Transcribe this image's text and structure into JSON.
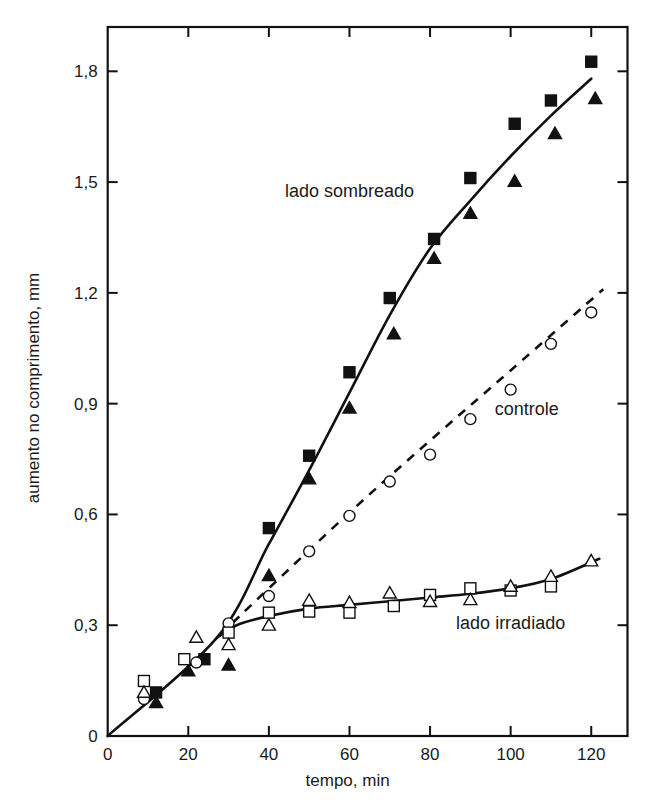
{
  "chart_data": {
    "type": "scatter",
    "title": "",
    "xlabel": "tempo, min",
    "ylabel": "aumento no comprimento, mm",
    "xlim": [
      0,
      129
    ],
    "ylim": [
      0,
      1.92
    ],
    "grid": false,
    "legend": "none (inline annotations)",
    "x_ticks": [
      0,
      20,
      40,
      60,
      80,
      100,
      120
    ],
    "x_tick_labels": [
      "0",
      "20",
      "40",
      "60",
      "80",
      "100",
      "120"
    ],
    "y_ticks": [
      0,
      0.3,
      0.6,
      0.9,
      1.2,
      1.5,
      1.8
    ],
    "y_tick_labels": [
      "0",
      "0,3",
      "0,6",
      "0,9",
      "1,2",
      "1,5",
      "1,8"
    ],
    "annotations": [
      {
        "text": "lado sombreado",
        "x": 60,
        "y": 1.46
      },
      {
        "text": "controle",
        "x": 104,
        "y": 0.87
      },
      {
        "text": "lado irradiado",
        "x": 100,
        "y": 0.29
      }
    ],
    "curves": [
      {
        "name": "lado sombreado",
        "style": "solid",
        "points": [
          [
            0,
            0
          ],
          [
            27,
            0.265
          ],
          [
            40,
            0.52
          ],
          [
            50,
            0.72
          ],
          [
            60,
            0.93
          ],
          [
            70,
            1.14
          ],
          [
            80,
            1.32
          ],
          [
            90,
            1.45
          ],
          [
            100,
            1.57
          ],
          [
            110,
            1.68
          ],
          [
            120,
            1.78
          ]
        ]
      },
      {
        "name": "controle",
        "style": "dashed",
        "points": [
          [
            28,
            0.275
          ],
          [
            40,
            0.4
          ],
          [
            60,
            0.605
          ],
          [
            80,
            0.8
          ],
          [
            100,
            0.99
          ],
          [
            123,
            1.21
          ]
        ]
      },
      {
        "name": "lado irradiado",
        "style": "solid",
        "points": [
          [
            27,
            0.265
          ],
          [
            32,
            0.3
          ],
          [
            40,
            0.325
          ],
          [
            50,
            0.345
          ],
          [
            60,
            0.355
          ],
          [
            70,
            0.365
          ],
          [
            80,
            0.375
          ],
          [
            90,
            0.385
          ],
          [
            100,
            0.4
          ],
          [
            110,
            0.425
          ],
          [
            122,
            0.48
          ]
        ]
      }
    ],
    "series": [
      {
        "name": "lado sombreado (quadrado cheio)",
        "marker": "filled-square",
        "points": [
          [
            12,
            0.118
          ],
          [
            24,
            0.208
          ],
          [
            40,
            0.563
          ],
          [
            50,
            0.759
          ],
          [
            60,
            0.985
          ],
          [
            70,
            1.186
          ],
          [
            81,
            1.346
          ],
          [
            90,
            1.511
          ],
          [
            101,
            1.658
          ],
          [
            110,
            1.721
          ],
          [
            120,
            1.826
          ]
        ]
      },
      {
        "name": "lado sombreado (triângulo cheio)",
        "marker": "filled-triangle",
        "points": [
          [
            12,
            0.09
          ],
          [
            20,
            0.176
          ],
          [
            30,
            0.192
          ],
          [
            40,
            0.434
          ],
          [
            50,
            0.696
          ],
          [
            60,
            0.888
          ],
          [
            71,
            1.089
          ],
          [
            81,
            1.293
          ],
          [
            90,
            1.415
          ],
          [
            101,
            1.502
          ],
          [
            111,
            1.631
          ],
          [
            121,
            1.726
          ]
        ]
      },
      {
        "name": "controle (círculo aberto)",
        "marker": "open-circle",
        "points": [
          [
            9,
            0.1
          ],
          [
            22,
            0.199
          ],
          [
            30,
            0.305
          ],
          [
            40,
            0.379
          ],
          [
            50,
            0.5
          ],
          [
            60,
            0.596
          ],
          [
            70,
            0.689
          ],
          [
            80,
            0.762
          ],
          [
            90,
            0.858
          ],
          [
            100,
            0.938
          ],
          [
            110,
            1.062
          ],
          [
            120,
            1.147
          ]
        ]
      },
      {
        "name": "lado irradiado (quadrado aberto)",
        "marker": "open-square",
        "points": [
          [
            9,
            0.149
          ],
          [
            19,
            0.208
          ],
          [
            30,
            0.28
          ],
          [
            40,
            0.334
          ],
          [
            50,
            0.337
          ],
          [
            60,
            0.334
          ],
          [
            71,
            0.352
          ],
          [
            80,
            0.382
          ],
          [
            90,
            0.4
          ],
          [
            100,
            0.394
          ],
          [
            110,
            0.405
          ]
        ]
      },
      {
        "name": "lado irradiado (triângulo aberto)",
        "marker": "open-triangle",
        "points": [
          [
            9,
            0.118
          ],
          [
            22,
            0.267
          ],
          [
            30,
            0.247
          ],
          [
            40,
            0.3
          ],
          [
            50,
            0.367
          ],
          [
            60,
            0.361
          ],
          [
            70,
            0.387
          ],
          [
            80,
            0.364
          ],
          [
            90,
            0.369
          ],
          [
            100,
            0.405
          ],
          [
            110,
            0.432
          ],
          [
            120,
            0.474
          ]
        ]
      }
    ]
  }
}
